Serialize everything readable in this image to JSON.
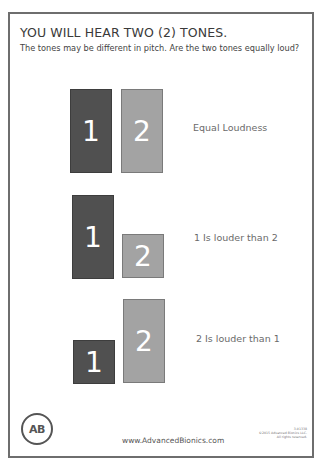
{
  "header": {
    "title": "YOU WILL HEAR TWO (2) TONES.",
    "subtitle": "The tones may be different in pitch. Are the two tones equally loud?"
  },
  "rows": [
    {
      "label": "Equal Loudness",
      "bars": [
        {
          "number": "1",
          "shade": "dark",
          "x": 70,
          "y": 89,
          "w": 42,
          "h": 84
        },
        {
          "number": "2",
          "shade": "light",
          "x": 121,
          "y": 89,
          "w": 42,
          "h": 84
        }
      ],
      "label_pos": {
        "x": 193,
        "y": 122
      }
    },
    {
      "label": "1 Is louder than 2",
      "bars": [
        {
          "number": "1",
          "shade": "dark",
          "x": 72,
          "y": 195,
          "w": 42,
          "h": 84
        },
        {
          "number": "2",
          "shade": "light",
          "x": 122,
          "y": 234,
          "w": 42,
          "h": 44
        }
      ],
      "label_pos": {
        "x": 194,
        "y": 232
      }
    },
    {
      "label": "2 Is louder than 1",
      "bars": [
        {
          "number": "1",
          "shade": "dark",
          "x": 73,
          "y": 340,
          "w": 42,
          "h": 44
        },
        {
          "number": "2",
          "shade": "light",
          "x": 123,
          "y": 299,
          "w": 42,
          "h": 84
        }
      ],
      "label_pos": {
        "x": 196,
        "y": 333
      }
    }
  ],
  "colors": {
    "dark_bar": "#505050",
    "light_bar": "#a3a3a3",
    "text": "#3a3a3a",
    "border": "#6e6e6e"
  },
  "footer": {
    "logo_text": "AB",
    "url": "www.AdvancedBionics.com",
    "legal_lines": [
      "3-01338",
      "©2015 Advanced Bionics LLC.",
      "All rights reserved."
    ]
  }
}
